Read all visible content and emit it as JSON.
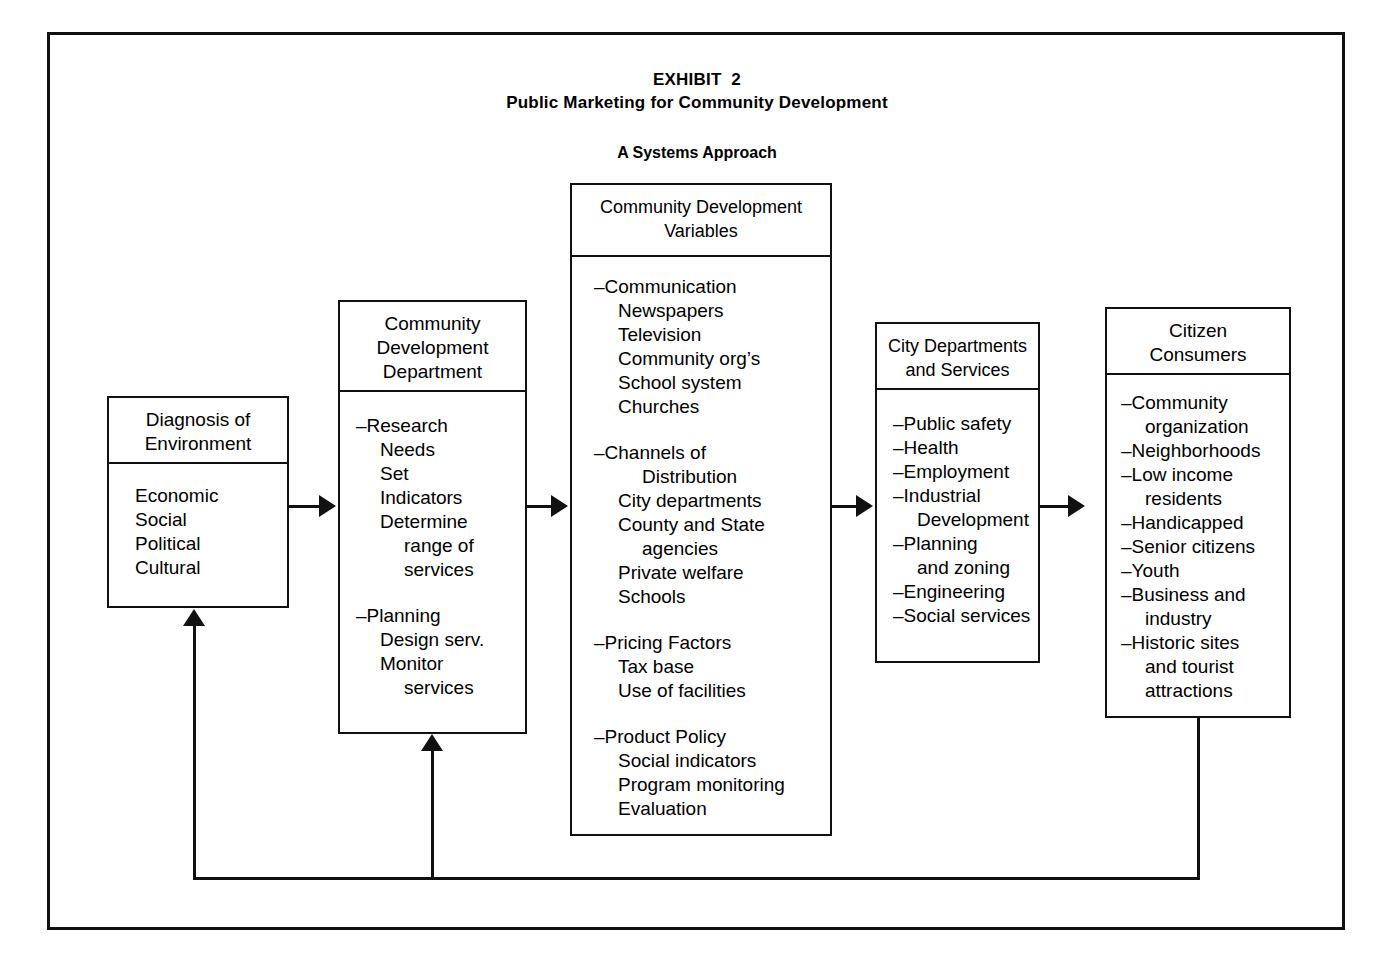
{
  "exhibit": {
    "title_line1": "EXHIBIT  2",
    "title_line2": "Public Marketing for Community Development",
    "subtitle": "A Systems Approach"
  },
  "colors": {
    "ink": "#111111",
    "paper": "#ffffff"
  },
  "nodes": {
    "diagnosis": {
      "header": "Diagnosis of\nEnvironment",
      "items": [
        "Economic",
        "Social",
        "Political",
        "Cultural"
      ]
    },
    "department": {
      "header": "Community\nDevelopment\nDepartment",
      "group1": {
        "heading": "–Research",
        "items": [
          "Needs",
          "Set",
          "Indicators",
          "Determine",
          "range of",
          "services"
        ]
      },
      "group2": {
        "heading": "–Planning",
        "items": [
          "Design serv.",
          "Monitor",
          "services"
        ]
      }
    },
    "variables": {
      "header": "Community Development\nVariables",
      "group1": {
        "heading": "–Communication",
        "items": [
          "Newspapers",
          "Television",
          "Community org’s",
          "School system",
          "Churches"
        ]
      },
      "group2": {
        "heading": "–Channels of",
        "items": [
          "Distribution",
          "City departments",
          "County and State",
          "agencies",
          "Private welfare",
          "Schools"
        ]
      },
      "group3": {
        "heading": "–Pricing Factors",
        "items": [
          "Tax base",
          "Use of facilities"
        ]
      },
      "group4": {
        "heading": "–Product Policy",
        "items": [
          "Social indicators",
          "Program monitoring",
          "Evaluation"
        ]
      }
    },
    "city_departments": {
      "header": "City Departments\nand Services",
      "items": [
        "–Public safety",
        "–Health",
        "–Employment",
        "–Industrial",
        "Development",
        "–Planning",
        "and zoning",
        "–Engineering",
        "–Social services"
      ]
    },
    "citizens": {
      "header": "Citizen\nConsumers",
      "items": [
        "–Community",
        "organization",
        "–Neighborhoods",
        "–Low income",
        "residents",
        "–Handicapped",
        "–Senior citizens",
        "–Youth",
        "–Business and",
        "industry",
        "–Historic sites",
        "and tourist",
        "attractions"
      ]
    }
  }
}
